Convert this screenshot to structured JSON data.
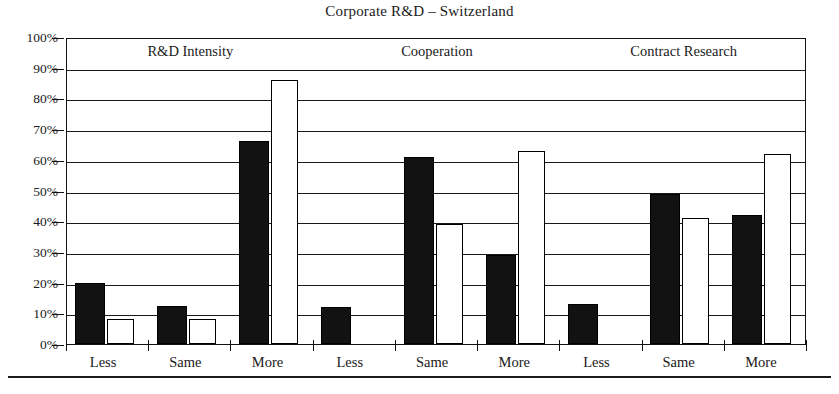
{
  "chart_data": {
    "type": "bar",
    "title": "Corporate R&D – Switzerland",
    "xlabel": "",
    "ylabel": "",
    "ylim": [
      0,
      100
    ],
    "y_unit": "%",
    "grid": true,
    "legend": "none",
    "y_ticks": [
      "0%",
      "10%",
      "20%",
      "30%",
      "40%",
      "50%",
      "60%",
      "70%",
      "80%",
      "90%",
      "100%"
    ],
    "y_tick_values": [
      0,
      10,
      20,
      30,
      40,
      50,
      60,
      70,
      80,
      90,
      100
    ],
    "group_labels": [
      "R&D Intensity",
      "Cooperation",
      "Contract Research"
    ],
    "categories": [
      "Less",
      "Same",
      "More",
      "Less",
      "Same",
      "More",
      "Less",
      "Same",
      "More"
    ],
    "series": [
      {
        "name": "dark",
        "fill": "#121212",
        "values": [
          20,
          12.5,
          66,
          12,
          61,
          29,
          13,
          49,
          42
        ]
      },
      {
        "name": "light",
        "fill": "#ffffff",
        "values": [
          8,
          8,
          86,
          null,
          39,
          63,
          null,
          41,
          62
        ]
      }
    ],
    "groups": [
      {
        "label": "R&D Intensity",
        "bars": [
          {
            "category": "Less",
            "dark": 20,
            "light": 8
          },
          {
            "category": "Same",
            "dark": 12.5,
            "light": 8
          },
          {
            "category": "More",
            "dark": 66,
            "light": 86
          }
        ]
      },
      {
        "label": "Cooperation",
        "bars": [
          {
            "category": "Less",
            "dark": 12,
            "light": null
          },
          {
            "category": "Same",
            "dark": 61,
            "light": 39
          },
          {
            "category": "More",
            "dark": 29,
            "light": 63
          }
        ]
      },
      {
        "label": "Contract Research",
        "bars": [
          {
            "category": "Less",
            "dark": 13,
            "light": null
          },
          {
            "category": "Same",
            "dark": 49,
            "light": 41
          },
          {
            "category": "More",
            "dark": 42,
            "light": 62
          }
        ]
      }
    ]
  }
}
